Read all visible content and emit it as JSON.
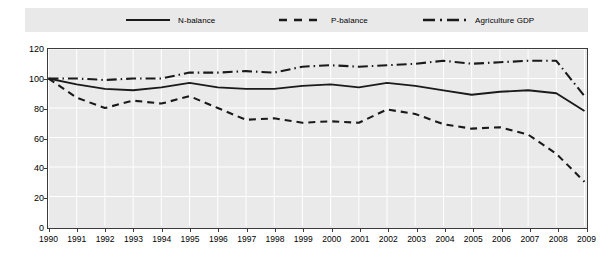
{
  "chart_data": {
    "type": "line",
    "title": "",
    "xlabel": "",
    "ylabel": "",
    "ylim": [
      0,
      120
    ],
    "ytick_values": [
      0,
      20,
      40,
      60,
      80,
      100,
      120
    ],
    "grid": true,
    "legend_position": "top",
    "categories": [
      "1990",
      "1991",
      "1992",
      "1993",
      "1994",
      "1995",
      "1996",
      "1997",
      "1998",
      "1999",
      "2000",
      "2001",
      "2002",
      "2003",
      "2004",
      "2005",
      "2006",
      "2007",
      "2008",
      "2009"
    ],
    "series": [
      {
        "name": "N-balance",
        "style": "solid",
        "color": "#1a1a1a",
        "values": [
          100,
          96,
          93,
          92,
          94,
          97,
          94,
          93,
          93,
          95,
          96,
          94,
          97,
          95,
          92,
          89,
          91,
          92,
          90,
          78
        ]
      },
      {
        "name": "P-balance",
        "style": "dashed",
        "color": "#1a1a1a",
        "values": [
          100,
          87,
          80,
          85,
          83,
          88,
          80,
          72,
          73,
          70,
          71,
          70,
          79,
          76,
          69,
          66,
          67,
          62,
          49,
          30
        ]
      },
      {
        "name": "Agriculture GDP",
        "style": "dash-dot",
        "color": "#1a1a1a",
        "values": [
          100,
          100,
          99,
          100,
          100,
          104,
          104,
          105,
          104,
          108,
          109,
          108,
          109,
          110,
          112,
          110,
          111,
          112,
          112,
          88
        ]
      }
    ]
  },
  "legend": {
    "entries": [
      {
        "label": "N-balance",
        "icon": "solid-line-icon"
      },
      {
        "label": "P-balance",
        "icon": "dashed-line-icon"
      },
      {
        "label": "Agriculture GDP",
        "icon": "dash-dot-line-icon"
      }
    ]
  },
  "colors": {
    "plot_background": "#eaeaea",
    "legend_background": "#e9e9e9",
    "axis": "#3b3b3b",
    "gridline": "#ffffff",
    "series": "#1a1a1a"
  }
}
